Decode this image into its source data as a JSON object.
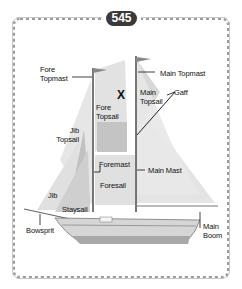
{
  "badge": {
    "number": "545"
  },
  "target_marker": "X",
  "labels": {
    "fore_topmast_1": "Fore",
    "fore_topmast_2": "Topmast",
    "main_topmast": "Main Topmast",
    "main_topsail_1": "Main",
    "main_topsail_2": "Topsail",
    "gaff": "Gaff",
    "fore_topsail_1": "Fore",
    "fore_topsail_2": "Topsail",
    "jib_topsail_1": "Jib",
    "jib_topsail_2": "Topsail",
    "foremast": "Foremast",
    "main_mast": "Main Mast",
    "foresail": "Foresail",
    "jib": "Jib",
    "staysail": "Staysail",
    "bowsprit": "Bowsprit",
    "main_boom_1": "Main",
    "main_boom_2": "Boom"
  },
  "colors": {
    "sail_light": "#e6e6e6",
    "sail_mid": "#d2d2d2",
    "sail_dark": "#b8b8b8",
    "badge_bg": "#3a3a3a",
    "border": "#9a9a9a"
  }
}
